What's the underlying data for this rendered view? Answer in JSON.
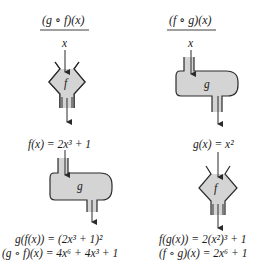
{
  "left_column": {
    "title": "(g ∘ f)(x)",
    "input_label": "x",
    "machine1_label": "f",
    "intermediate": "f(x) = 2x³ + 1",
    "machine2_label": "g",
    "result_line1": "g(f(x)) = (2x³ + 1)²",
    "result_line2": "(g ∘ f)(x) = 4x⁶ + 4x³ + 1"
  },
  "right_column": {
    "title": "(f ∘ g)(x)",
    "input_label": "x",
    "machine1_label": "g",
    "intermediate": "g(x) = x²",
    "machine2_label": "f",
    "result_line1": "f(g(x)) = 2(x²)³ + 1",
    "result_line2": "(f ∘ g)(x) = 2x⁶ + 1"
  },
  "colors": {
    "machine_fill": "#d4d4d4",
    "stroke": "#2a2a2a",
    "text": "#1a1a1a"
  }
}
